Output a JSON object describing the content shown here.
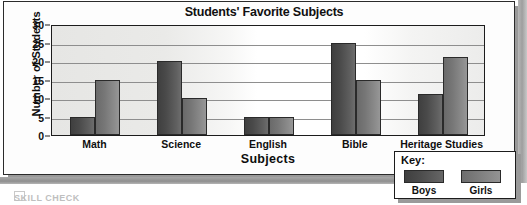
{
  "chart_data": {
    "type": "bar",
    "title": "Students' Favorite Subjects",
    "xlabel": "Subjects",
    "ylabel": "Number of Students",
    "categories": [
      "Math",
      "Science",
      "English",
      "Bible",
      "Heritage Studies"
    ],
    "series": [
      {
        "name": "Boys",
        "values": [
          5,
          20,
          5,
          25,
          11
        ],
        "color": "#4a4a4a"
      },
      {
        "name": "Girls",
        "values": [
          15,
          10,
          5,
          15,
          21
        ],
        "color": "#8c8c8c"
      }
    ],
    "ylim": [
      0,
      30
    ],
    "yticks": [
      0,
      5,
      10,
      15,
      20,
      25,
      30
    ],
    "grid": true,
    "legend_position": "bottom-right",
    "legend_title": "Key:"
  },
  "legend": {
    "title": "Key:",
    "entries": [
      {
        "label": "Boys"
      },
      {
        "label": "Girls"
      }
    ]
  },
  "footer": {
    "mark": "SKILL CHECK"
  }
}
